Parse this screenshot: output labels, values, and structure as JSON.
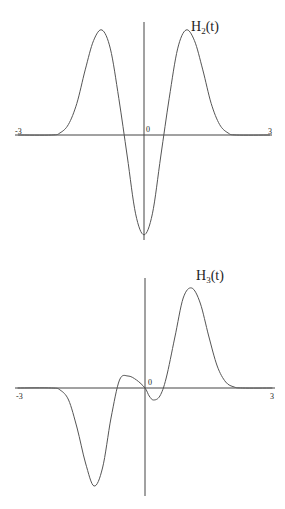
{
  "chart_data": [
    {
      "type": "line",
      "title": "H_2(t)",
      "title_main": "H",
      "title_sub": "2",
      "title_tail": "(t)",
      "xlabel": "",
      "ylabel": "",
      "xlim": [
        -3,
        3
      ],
      "x_ticks": [
        "-3",
        "0",
        "3"
      ],
      "grid": false,
      "series": [
        {
          "name": "H_2(t)",
          "x": [
            -3,
            -2.2,
            -2,
            -1.8,
            -1.6,
            -1.4,
            -1.2,
            -1.0,
            -0.8,
            -0.6,
            -0.4,
            -0.2,
            0,
            0.2,
            0.4,
            0.6,
            0.8,
            1.0,
            1.2,
            1.4,
            1.6,
            1.8,
            2,
            2.2,
            3
          ],
          "y": [
            0,
            0,
            0.02,
            0.1,
            0.3,
            0.62,
            0.9,
            1.0,
            0.82,
            0.35,
            -0.2,
            -0.75,
            -0.95,
            -0.75,
            -0.2,
            0.35,
            0.82,
            1.0,
            0.9,
            0.62,
            0.3,
            0.1,
            0.02,
            0,
            0
          ]
        }
      ],
      "ylim": [
        -1,
        1
      ]
    },
    {
      "type": "line",
      "title": "H_3(t)",
      "title_main": "H",
      "title_sub": "3",
      "title_tail": "(t)",
      "xlabel": "",
      "ylabel": "",
      "xlim": [
        -3,
        3
      ],
      "x_ticks": [
        "-3",
        "0",
        "3"
      ],
      "grid": false,
      "series": [
        {
          "name": "H_3(t)",
          "x": [
            -3,
            -2.2,
            -2,
            -1.8,
            -1.6,
            -1.4,
            -1.2,
            -1.0,
            -0.8,
            -0.6,
            -0.4,
            -0.2,
            0,
            0.1,
            0.2,
            0.35,
            0.5,
            0.7,
            0.9,
            1.1,
            1.3,
            1.5,
            1.7,
            1.9,
            2.1,
            2.3,
            3
          ],
          "y": [
            0,
            0,
            -0.02,
            -0.12,
            -0.4,
            -0.75,
            -0.98,
            -0.8,
            -0.3,
            0.08,
            0.12,
            0.08,
            0.0,
            -0.08,
            -0.12,
            -0.08,
            0.1,
            0.5,
            0.9,
            1.0,
            0.85,
            0.52,
            0.22,
            0.06,
            0.01,
            0,
            0
          ]
        }
      ],
      "ylim": [
        -1,
        1
      ]
    }
  ]
}
